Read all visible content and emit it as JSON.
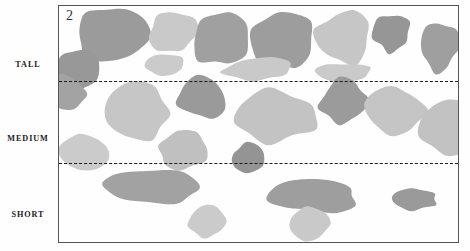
{
  "figure": {
    "panel_number": "2",
    "category_labels": {
      "tall": "TALL",
      "medium": "MEDIUM",
      "short": "SHORT"
    }
  },
  "chart_data": {
    "type": "scatter",
    "title": "",
    "subtitle": "",
    "xlabel": "",
    "ylabel": "",
    "grid": false,
    "legend_position": "none",
    "panel_label": "2",
    "categories": [
      "TALL",
      "MEDIUM",
      "SHORT"
    ],
    "band_boundaries_px": [
      75,
      157
    ],
    "plot_frame_px": {
      "x": 58,
      "y": 5,
      "width": 401,
      "height": 238
    },
    "palette": {
      "dark_gray": "#949494",
      "mid_gray": "#a9a9a9",
      "light_gray": "#c7c7c7",
      "pale_gray": "#d4d4d4",
      "frame": "#555555",
      "dash": "#1b1b1b",
      "background": "#fefefe",
      "text": "#1a1a1a"
    },
    "series": [
      {
        "name": "TALL",
        "count": 11,
        "blobs": [
          {
            "cx": 52,
            "cy": 30,
            "rx": 36,
            "ry": 29,
            "fill": "#9b9b9b",
            "seed": 11
          },
          {
            "cx": 114,
            "cy": 26,
            "rx": 24,
            "ry": 22,
            "fill": "#c9c9c9",
            "seed": 12
          },
          {
            "cx": 160,
            "cy": 33,
            "rx": 29,
            "ry": 27,
            "fill": "#a0a0a0",
            "seed": 13
          },
          {
            "cx": 224,
            "cy": 33,
            "rx": 30,
            "ry": 30,
            "fill": "#9d9d9d",
            "seed": 14
          },
          {
            "cx": 283,
            "cy": 32,
            "rx": 28,
            "ry": 27,
            "fill": "#c6c6c6",
            "seed": 15
          },
          {
            "cx": 333,
            "cy": 27,
            "rx": 19,
            "ry": 19,
            "fill": "#969696",
            "seed": 16
          },
          {
            "cx": 380,
            "cy": 40,
            "rx": 19,
            "ry": 26,
            "fill": "#9f9f9f",
            "seed": 17
          },
          {
            "cx": 17,
            "cy": 63,
            "rx": 22,
            "ry": 20,
            "fill": "#989898",
            "seed": 18
          },
          {
            "cx": 104,
            "cy": 58,
            "rx": 20,
            "ry": 11,
            "fill": "#cbcbcb",
            "seed": 19
          },
          {
            "cx": 198,
            "cy": 63,
            "rx": 34,
            "ry": 12,
            "fill": "#c9c9c9",
            "seed": 20
          },
          {
            "cx": 285,
            "cy": 67,
            "rx": 27,
            "ry": 10,
            "fill": "#cacaca",
            "seed": 21
          }
        ]
      },
      {
        "name": "MEDIUM",
        "count": 10,
        "blobs": [
          {
            "cx": 6,
            "cy": 88,
            "rx": 22,
            "ry": 18,
            "fill": "#a3a3a3",
            "seed": 31
          },
          {
            "cx": 78,
            "cy": 108,
            "rx": 35,
            "ry": 29,
            "fill": "#c6c6c6",
            "seed": 32
          },
          {
            "cx": 143,
            "cy": 92,
            "rx": 25,
            "ry": 21,
            "fill": "#9a9a9a",
            "seed": 33
          },
          {
            "cx": 217,
            "cy": 110,
            "rx": 47,
            "ry": 26,
            "fill": "#c3c3c3",
            "seed": 34
          },
          {
            "cx": 284,
            "cy": 95,
            "rx": 24,
            "ry": 22,
            "fill": "#9b9b9b",
            "seed": 35
          },
          {
            "cx": 337,
            "cy": 105,
            "rx": 30,
            "ry": 23,
            "fill": "#c5c5c5",
            "seed": 36
          },
          {
            "cx": 393,
            "cy": 122,
            "rx": 31,
            "ry": 26,
            "fill": "#c2c2c2",
            "seed": 37
          },
          {
            "cx": 25,
            "cy": 146,
            "rx": 26,
            "ry": 17,
            "fill": "#cbcbcb",
            "seed": 38
          },
          {
            "cx": 124,
            "cy": 145,
            "rx": 27,
            "ry": 19,
            "fill": "#c0c0c0",
            "seed": 39
          },
          {
            "cx": 190,
            "cy": 152,
            "rx": 18,
            "ry": 15,
            "fill": "#949494",
            "seed": 40
          }
        ]
      },
      {
        "name": "SHORT",
        "count": 5,
        "blobs": [
          {
            "cx": 95,
            "cy": 182,
            "rx": 50,
            "ry": 17,
            "fill": "#a2a2a2",
            "seed": 51
          },
          {
            "cx": 255,
            "cy": 190,
            "rx": 44,
            "ry": 17,
            "fill": "#9e9e9e",
            "seed": 52
          },
          {
            "cx": 356,
            "cy": 193,
            "rx": 24,
            "ry": 11,
            "fill": "#9a9a9a",
            "seed": 53
          },
          {
            "cx": 148,
            "cy": 215,
            "rx": 18,
            "ry": 16,
            "fill": "#cbcbcb",
            "seed": 54
          },
          {
            "cx": 250,
            "cy": 217,
            "rx": 21,
            "ry": 17,
            "fill": "#c9c9c9",
            "seed": 55
          }
        ]
      }
    ]
  }
}
